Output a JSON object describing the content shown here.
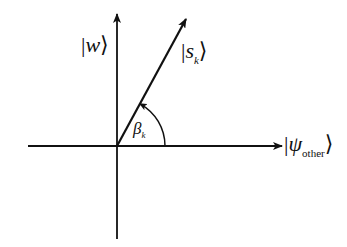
{
  "diagram": {
    "type": "vector-diagram",
    "colors": {
      "stroke": "#111111",
      "background": "#ffffff"
    },
    "origin": {
      "x": 117,
      "y": 146
    },
    "axes": {
      "horizontal": {
        "x1": 28,
        "x2": 282,
        "y": 146,
        "label_symbol": "ψ",
        "label_subscript": "other"
      },
      "vertical": {
        "x": 117,
        "y1": 239,
        "y2": 14,
        "label_symbol": "w"
      }
    },
    "vector": {
      "x2": 186,
      "y2": 19,
      "label_symbol": "s",
      "label_subscript": "k"
    },
    "angle": {
      "radius": 48,
      "label_symbol": "β",
      "label_subscript": "k"
    }
  },
  "labels": {
    "w_ket": {
      "open": "|",
      "symbol": "w",
      "close": "⟩"
    },
    "sk_ket": {
      "open": "|",
      "symbol": "s",
      "subscript": "k",
      "close": "⟩"
    },
    "psi_ket": {
      "open": "|",
      "symbol": "ψ",
      "subscript": "other",
      "close": "⟩"
    },
    "beta": {
      "symbol": "β",
      "subscript": "k"
    }
  }
}
